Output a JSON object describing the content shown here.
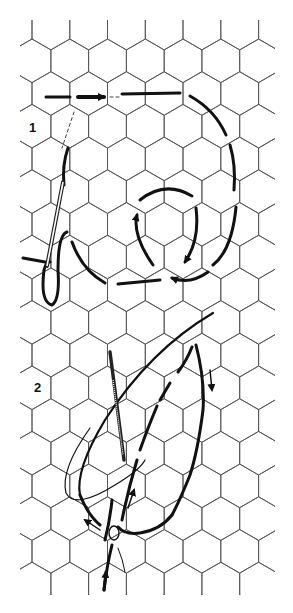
{
  "diagram": {
    "background_grid": "pointy-top hexagon mesh",
    "colors": {
      "grid": "#555555",
      "thread": "#111111",
      "background": "#ffffff"
    },
    "steps": [
      {
        "label": "1",
        "x": 29,
        "y": 120,
        "content": "Thread darned in a spiral/loop around a central hexagon, entering from left with arrow, needle and thread loop at left"
      },
      {
        "label": "2",
        "x": 34,
        "y": 380,
        "content": "Needle wrapping thread around outline of a leaf/petal shape; arrows show direction of working"
      }
    ]
  }
}
